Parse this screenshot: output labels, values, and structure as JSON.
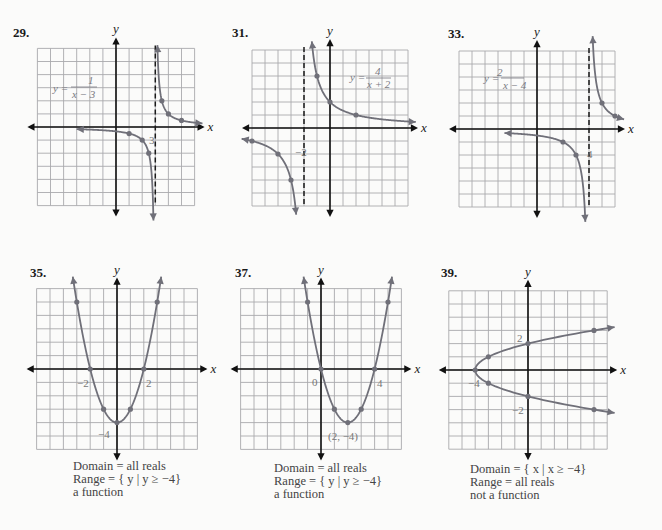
{
  "page": {
    "problems": [
      {
        "number": "29.",
        "equation": {
          "lhs": "y =",
          "numerator": "1",
          "denominator": "x − 3"
        },
        "asymptote_label": "3",
        "ticks": []
      },
      {
        "number": "31.",
        "equation": {
          "lhs": "y =",
          "numerator": "4",
          "denominator": "x + 2"
        },
        "asymptote_label": "−2",
        "ticks": []
      },
      {
        "number": "33.",
        "equation": {
          "lhs": "y =",
          "numerator": "2",
          "denominator": "x − 4"
        },
        "asymptote_label": "4",
        "ticks": []
      },
      {
        "number": "35.",
        "ticks": [
          "−2",
          "2",
          "−4"
        ],
        "caption": {
          "domain": "Domain = all reals",
          "range": "Range = { y | y ≥ −4}",
          "function": "a function"
        }
      },
      {
        "number": "37.",
        "ticks": [
          "0",
          "4",
          "(2, −4)"
        ],
        "caption": {
          "domain": "Domain = all reals",
          "range": "Range = { y | y ≥ −4}",
          "function": "a function"
        }
      },
      {
        "number": "39.",
        "ticks": [
          "2",
          "−2",
          "−4"
        ],
        "caption": {
          "domain": "Domain = { x | x ≥ −4}",
          "range": "Range = all reals",
          "function": "not a function"
        }
      }
    ],
    "axis_labels": {
      "x": "x",
      "y": "y"
    }
  },
  "colors": {
    "grid": "#a9a9ad",
    "axis": "#111111",
    "curve": "#707079",
    "asymptote": "#1a1a1a",
    "paper": "#fbfbfa"
  },
  "chart_data": [
    {
      "id": "29",
      "type": "line",
      "title": "29.",
      "function": "y = 1/(x-3)",
      "xlabel": "x",
      "ylabel": "y",
      "xlim": [
        -6,
        6
      ],
      "ylim": [
        -6,
        6
      ],
      "grid": true,
      "vertical_asymptote": 3,
      "origin_px": [
        116,
        127
      ],
      "cell_px": 13.1,
      "series": [
        {
          "name": "left branch",
          "x_range": [
            -3,
            2.86
          ],
          "points": [
            [
              1,
              -0.5
            ],
            [
              2,
              -1
            ],
            [
              2.5,
              -2
            ]
          ],
          "arrow_start": true,
          "arrow_end": true
        },
        {
          "name": "right branch",
          "x_range": [
            3.16,
            6.6
          ],
          "points": [
            [
              3.5,
              2
            ],
            [
              4,
              1
            ],
            [
              5,
              0.5
            ]
          ],
          "arrow_start": true,
          "arrow_end": true
        }
      ],
      "annotations": [
        {
          "text": "3",
          "x": 3,
          "y": -1
        }
      ]
    },
    {
      "id": "31",
      "type": "line",
      "title": "31.",
      "function": "y = 4/(x+2)",
      "xlabel": "x",
      "ylabel": "y",
      "xlim": [
        -6,
        6
      ],
      "ylim": [
        -6,
        6
      ],
      "grid": true,
      "vertical_asymptote": -2,
      "origin_px": [
        330,
        128
      ],
      "cell_px": 13,
      "series": [
        {
          "name": "right branch",
          "x_range": [
            -1.4,
            6.6
          ],
          "points": [
            [
              -1,
              4
            ],
            [
              0,
              2
            ],
            [
              2,
              1
            ]
          ],
          "arrow_start": true,
          "arrow_end": true
        },
        {
          "name": "left branch",
          "x_range": [
            -6.8,
            -2.6
          ],
          "points": [
            [
              -6,
              -1
            ],
            [
              -4,
              -2
            ],
            [
              -3,
              -4
            ]
          ],
          "arrow_start": true,
          "arrow_end": true
        }
      ],
      "annotations": [
        {
          "text": "−2",
          "x": -2,
          "y": -1.9
        }
      ]
    },
    {
      "id": "33",
      "type": "line",
      "title": "33.",
      "function": "y = 2/(x-4)",
      "xlabel": "x",
      "ylabel": "y",
      "xlim": [
        -6,
        6
      ],
      "ylim": [
        -6,
        6
      ],
      "grid": true,
      "vertical_asymptote": 4,
      "origin_px": [
        537,
        129
      ],
      "cell_px": 13,
      "series": [
        {
          "name": "right branch",
          "x_range": [
            4.28,
            6.7
          ],
          "points": [
            [
              5,
              2
            ],
            [
              6,
              1
            ]
          ],
          "arrow_start": true,
          "arrow_end": true
        },
        {
          "name": "left branch",
          "x_range": [
            -2.5,
            3.72
          ],
          "points": [
            [
              2,
              -1
            ],
            [
              3,
              -2
            ]
          ],
          "arrow_start": true,
          "arrow_end": true
        }
      ],
      "annotations": [
        {
          "text": "4",
          "x": 4,
          "y": -2
        }
      ]
    },
    {
      "id": "35",
      "type": "line",
      "title": "35.",
      "function": "y = x^2 - 4",
      "xlabel": "x",
      "ylabel": "y",
      "xlim": [
        -6,
        6
      ],
      "ylim": [
        -6,
        6
      ],
      "grid": true,
      "origin_px": [
        117,
        369
      ],
      "cell_px": 13.4,
      "series": [
        {
          "name": "parabola",
          "x_range": [
            -3.3,
            3.3
          ],
          "points": [
            [
              -3,
              5
            ],
            [
              -2,
              0
            ],
            [
              -1,
              -3
            ],
            [
              0,
              -4
            ],
            [
              1,
              -3
            ],
            [
              2,
              0
            ],
            [
              3,
              5
            ]
          ],
          "arrow_start": true,
          "arrow_end": true
        }
      ],
      "annotations": [
        {
          "text": "−2",
          "x": -2,
          "y": 0
        },
        {
          "text": "2",
          "x": 2,
          "y": 0
        },
        {
          "text": "−4",
          "x": 0,
          "y": -4
        }
      ],
      "domain": "all reals",
      "range": "y ≥ −4",
      "is_function": true
    },
    {
      "id": "37",
      "type": "line",
      "title": "37.",
      "function": "y = x^2 - 4x",
      "xlabel": "x",
      "ylabel": "y",
      "xlim": [
        -6,
        6
      ],
      "ylim": [
        -6,
        6
      ],
      "grid": true,
      "origin_px": [
        321,
        369
      ],
      "cell_px": 13.4,
      "series": [
        {
          "name": "parabola",
          "x_range": [
            -1.3,
            5.3
          ],
          "points": [
            [
              -1,
              5
            ],
            [
              0,
              0
            ],
            [
              1,
              -3
            ],
            [
              2,
              -4
            ],
            [
              3,
              -3
            ],
            [
              4,
              0
            ],
            [
              5,
              5
            ]
          ],
          "arrow_start": true,
          "arrow_end": true
        }
      ],
      "annotations": [
        {
          "text": "0",
          "x": 0,
          "y": 0
        },
        {
          "text": "4",
          "x": 4,
          "y": 0
        },
        {
          "text": "(2, −4)",
          "x": 2,
          "y": -4
        }
      ],
      "domain": "all reals",
      "range": "y ≥ −4",
      "is_function": true
    },
    {
      "id": "39",
      "type": "line",
      "title": "39.",
      "function": "x = y^2 - 4",
      "xlabel": "x",
      "ylabel": "y",
      "xlim": [
        -6,
        6
      ],
      "ylim": [
        -6,
        6
      ],
      "grid": true,
      "origin_px": [
        528,
        370
      ],
      "cell_px": 13.2,
      "series": [
        {
          "name": "sideways parabola",
          "y_range": [
            -3.25,
            3.25
          ],
          "points": [
            [
              -4,
              0
            ],
            [
              -3,
              1
            ],
            [
              -3,
              -1
            ],
            [
              0,
              2
            ],
            [
              0,
              -2
            ],
            [
              5,
              3
            ],
            [
              5,
              -3
            ]
          ],
          "arrow_start": true,
          "arrow_end": true
        }
      ],
      "annotations": [
        {
          "text": "2",
          "x": 0,
          "y": 2
        },
        {
          "text": "−2",
          "x": 0,
          "y": -2
        },
        {
          "text": "−4",
          "x": -4,
          "y": 0
        }
      ],
      "domain": "x ≥ −4",
      "range": "all reals",
      "is_function": false
    }
  ]
}
